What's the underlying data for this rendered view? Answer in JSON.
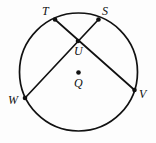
{
  "figure": {
    "type": "circle-geometry-diagram",
    "background_color": "#fdfdfd",
    "stroke_color": "#111111",
    "stroke_width": 1.6,
    "width": 156,
    "height": 143,
    "circle": {
      "name": "circle-Q",
      "center": {
        "x": 78.5,
        "y": 72
      },
      "radius": 59
    },
    "center_point": {
      "label": "Q",
      "x": 78.5,
      "y": 72.5,
      "label_x": 74,
      "label_y": 77,
      "dot_radius": 2.2
    },
    "points": [
      {
        "label": "T",
        "x": 55,
        "y": 19.5,
        "label_x": 42,
        "label_y": 5,
        "dot_radius": 2.2
      },
      {
        "label": "S",
        "x": 98.5,
        "y": 19.5,
        "label_x": 102,
        "label_y": 5,
        "dot_radius": 2.2
      },
      {
        "label": "U",
        "x": 78,
        "y": 41,
        "label_x": 74,
        "label_y": 45,
        "dot_radius": 2.2
      },
      {
        "label": "W",
        "x": 25,
        "y": 98,
        "label_x": 8,
        "label_y": 94,
        "dot_radius": 2.2
      },
      {
        "label": "V",
        "x": 134.5,
        "y": 90,
        "label_x": 139,
        "label_y": 88,
        "dot_radius": 2.2
      }
    ],
    "chords": [
      {
        "name": "chord-TV",
        "from": "T",
        "to": "V",
        "x1": 55,
        "y1": 19.5,
        "x2": 134.5,
        "y2": 90
      },
      {
        "name": "chord-SW",
        "from": "S",
        "to": "W",
        "x1": 98.5,
        "y1": 19.5,
        "x2": 25,
        "y2": 98
      }
    ],
    "intersection": {
      "name": "chord-intersection-U",
      "label": "U",
      "x": 78,
      "y": 41
    }
  }
}
